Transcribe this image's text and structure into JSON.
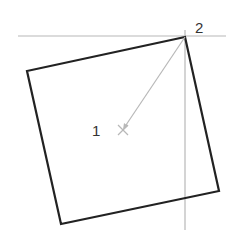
{
  "diagram": {
    "colors": {
      "background": "#ffffff",
      "shape_stroke": "#222222",
      "guide_stroke": "#b8b8b8",
      "label": "#333333"
    },
    "square": {
      "corners": [
        [
          185,
          37
        ],
        [
          219,
          191
        ],
        [
          61,
          224
        ],
        [
          27,
          71
        ]
      ]
    },
    "guides": {
      "horizontal": {
        "x1": 18,
        "y1": 36,
        "x2": 226,
        "y2": 36
      },
      "vertical": {
        "x1": 185,
        "y1": 30,
        "x2": 185,
        "y2": 230
      }
    },
    "arrow": {
      "from": [
        185,
        37
      ],
      "to": [
        123,
        130
      ]
    },
    "center_mark": {
      "x": 123,
      "y": 130
    },
    "labels": [
      {
        "id": "point-1",
        "text": "1",
        "x": 92,
        "y": 136
      },
      {
        "id": "point-2",
        "text": "2",
        "x": 195,
        "y": 33
      }
    ]
  }
}
